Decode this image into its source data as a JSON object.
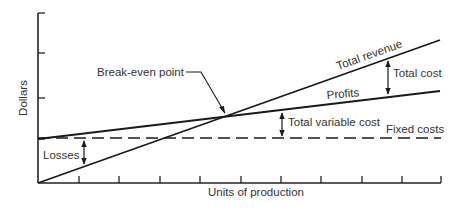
{
  "chart_data": {
    "type": "line",
    "title": "",
    "xlabel": "Units of production",
    "ylabel": "Dollars",
    "x_ticks": 10,
    "y_ticks": 4,
    "grid": false,
    "legend": "none (inline labels)",
    "series": [
      {
        "name": "Total revenue",
        "style": "solid",
        "x": [
          0,
          10
        ],
        "y": [
          0,
          10
        ]
      },
      {
        "name": "Total cost",
        "style": "solid",
        "x": [
          0,
          10
        ],
        "y": [
          3.1,
          6.5
        ]
      },
      {
        "name": "Fixed costs",
        "style": "dashed",
        "x": [
          0,
          10
        ],
        "y": [
          3.1,
          3.1
        ]
      }
    ],
    "annotations": [
      {
        "text": "Break-even point",
        "x": 4.7,
        "y": 4.7
      },
      {
        "text": "Losses",
        "type": "gap arrow",
        "between": [
          "Total cost",
          "Total revenue"
        ],
        "x": 1.1
      },
      {
        "text": "Total variable cost",
        "type": "gap arrow",
        "between": [
          "Total cost",
          "Fixed costs"
        ],
        "x": 6.1
      },
      {
        "text": "Total cost",
        "type": "gap arrow",
        "between": [
          "Total revenue",
          "Total cost"
        ],
        "x": 8.7
      },
      {
        "text": "Profits",
        "type": "region label"
      }
    ]
  },
  "labels": {
    "y_axis": "Dollars",
    "x_axis": "Units of production",
    "break_even": "Break-even point",
    "total_revenue": "Total revenue",
    "total_cost_arrow": "Total cost",
    "profits": "Profits",
    "total_variable_cost": "Total variable cost",
    "fixed_costs": "Fixed costs",
    "losses": "Losses"
  },
  "geometry": {
    "origin": [
      38,
      183
    ],
    "x_end": 441,
    "y_top": 13,
    "x_tick_positions": [
      79,
      119,
      160,
      200,
      241,
      281,
      321,
      362,
      402,
      441
    ],
    "y_tick_positions": [
      13,
      53,
      98,
      139
    ],
    "revenue_line": [
      [
        38,
        183
      ],
      [
        440,
        40
      ]
    ],
    "total_cost_line": [
      [
        38,
        139
      ],
      [
        440,
        91
      ]
    ],
    "fixed_cost_y": 138,
    "break_even": [
      228,
      116
    ]
  }
}
